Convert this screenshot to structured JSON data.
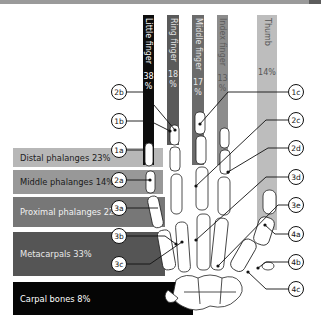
{
  "colors": {
    "little": "#0d0d0d",
    "ring": "#5a5a5a",
    "middle": "#6b6b6b",
    "index": "#8c8c8c",
    "thumb": "#bdbdbd",
    "distal": "#b7b7b7",
    "middle_band": "#989898",
    "proximal": "#777777",
    "metacarpals": "#555555",
    "carpals": "#050505"
  },
  "fingers": [
    {
      "name": "Little finger",
      "pct": "38",
      "unit": "%"
    },
    {
      "name": "Ring finger",
      "pct": "18",
      "unit": "%"
    },
    {
      "name": "Middle finger",
      "pct": "17",
      "unit": "%"
    },
    {
      "name": "Index finger",
      "pct": "13",
      "unit": "%"
    },
    {
      "name": "Thumb",
      "pct": "14%",
      "unit": ""
    }
  ],
  "bands": [
    {
      "label": "Distal phalanges 23%"
    },
    {
      "label": "Middle phalanges 14%"
    },
    {
      "label": "Proximal phalanges 22%"
    },
    {
      "label": "Metacarpals 33%"
    },
    {
      "label": "Carpal bones 8%"
    }
  ],
  "callouts_left": [
    "2b",
    "1b",
    "1a",
    "2a",
    "3a",
    "3b",
    "3c"
  ],
  "callouts_right": [
    "1c",
    "2c",
    "2d",
    "3d",
    "3e",
    "4a",
    "4b",
    "4c"
  ]
}
